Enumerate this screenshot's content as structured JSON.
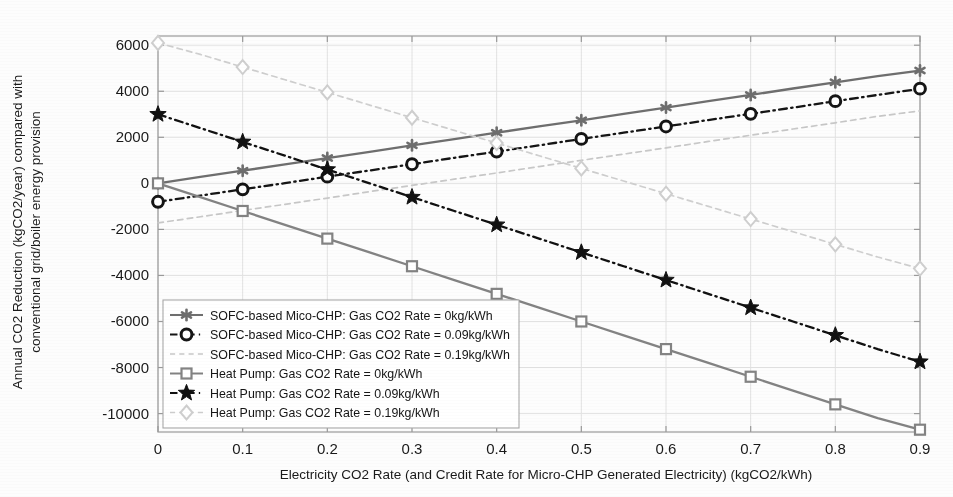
{
  "chart_data": {
    "type": "line",
    "title": "",
    "xlabel": "Electricity CO2 Rate (and Credit Rate for Micro-CHP Generated Electricity) (kgCO2/kWh)",
    "ylabel_line1": "Annual CO2 Reduction (kgCO2/year) compared with",
    "ylabel_line2": "conventional grid/boiler energy provision",
    "x": [
      0,
      0.05,
      0.1,
      0.15,
      0.2,
      0.25,
      0.3,
      0.35,
      0.4,
      0.45,
      0.5,
      0.55,
      0.6,
      0.65,
      0.7,
      0.75,
      0.8,
      0.85,
      0.9
    ],
    "xticks": [
      "0",
      "0.1",
      "0.2",
      "0.3",
      "0.4",
      "0.5",
      "0.6",
      "0.7",
      "0.8",
      "0.9"
    ],
    "xtick_values": [
      0,
      0.1,
      0.2,
      0.3,
      0.4,
      0.5,
      0.6,
      0.7,
      0.8,
      0.9
    ],
    "yticks": [
      "6000",
      "4000",
      "2000",
      "0",
      "-2000",
      "-4000",
      "-6000",
      "-8000",
      "-10000"
    ],
    "ytick_values": [
      6000,
      4000,
      2000,
      0,
      -2000,
      -4000,
      -6000,
      -8000,
      -10000
    ],
    "xlim": [
      0,
      0.9
    ],
    "ylim": [
      -10800,
      6400
    ],
    "grid": true,
    "legend_position": "lower-left-inside",
    "series": [
      {
        "name": "SOFC-based Mico-CHP: Gas CO2 Rate = 0kg/kWh",
        "marker": "asterisk",
        "linestyle": "solid",
        "color": "#6e6e6e",
        "values": [
          0,
          280,
          550,
          820,
          1100,
          1370,
          1650,
          1920,
          2200,
          2470,
          2740,
          3020,
          3290,
          3570,
          3840,
          4120,
          4390,
          4660,
          4900
        ]
      },
      {
        "name": "SOFC-based Mico-CHP: Gas CO2 Rate = 0.09kg/kWh",
        "marker": "circle",
        "linestyle": "dashdot",
        "color": "#151515",
        "values": [
          -800,
          -530,
          -260,
          10,
          290,
          560,
          830,
          1110,
          1380,
          1650,
          1930,
          2200,
          2470,
          2750,
          3020,
          3290,
          3570,
          3840,
          4110
        ]
      },
      {
        "name": "SOFC-based Mico-CHP: Gas CO2 Rate = 0.19kg/kWh",
        "marker": "none",
        "linestyle": "dashed",
        "color": "#c8c8c8",
        "values": [
          -1720,
          -1450,
          -1180,
          -910,
          -640,
          -360,
          -90,
          180,
          450,
          730,
          1000,
          1270,
          1540,
          1820,
          2090,
          2360,
          2630,
          2910,
          3150
        ]
      },
      {
        "name": "Heat Pump: Gas CO2 Rate = 0kg/kWh",
        "marker": "square",
        "linestyle": "solid",
        "color": "#838383",
        "values": [
          0,
          -600,
          -1200,
          -1800,
          -2400,
          -3000,
          -3600,
          -4200,
          -4800,
          -5400,
          -6000,
          -6600,
          -7200,
          -7800,
          -8400,
          -9000,
          -9600,
          -10200,
          -10700
        ]
      },
      {
        "name": "Heat Pump: Gas CO2 Rate = 0.09kg/kWh",
        "marker": "star",
        "linestyle": "dashdot",
        "color": "#111111",
        "values": [
          3000,
          2400,
          1800,
          1200,
          600,
          0,
          -600,
          -1200,
          -1800,
          -2400,
          -3000,
          -3600,
          -4200,
          -4800,
          -5400,
          -6000,
          -6600,
          -7200,
          -7750
        ]
      },
      {
        "name": "Heat Pump: Gas CO2 Rate = 0.19kg/kWh",
        "marker": "diamond",
        "linestyle": "dashed",
        "color": "#cfcfcf",
        "values": [
          6100,
          5600,
          5050,
          4500,
          3950,
          3400,
          2850,
          2300,
          1750,
          1200,
          650,
          100,
          -450,
          -1000,
          -1550,
          -2100,
          -2650,
          -3200,
          -3700
        ]
      }
    ]
  },
  "legend": {
    "items": [
      "SOFC-based Mico-CHP: Gas CO2 Rate = 0kg/kWh",
      "SOFC-based Mico-CHP: Gas CO2 Rate = 0.09kg/kWh",
      "SOFC-based Mico-CHP: Gas CO2 Rate = 0.19kg/kWh",
      "Heat Pump: Gas CO2 Rate = 0kg/kWh",
      "Heat Pump: Gas CO2 Rate = 0.09kg/kWh",
      "Heat Pump: Gas CO2 Rate = 0.19kg/kWh"
    ]
  },
  "colors": {
    "axis": "#9a9a9a",
    "grid": "#e2e2e2",
    "text": "#1a1a1a",
    "background": "#fdfdfd"
  }
}
